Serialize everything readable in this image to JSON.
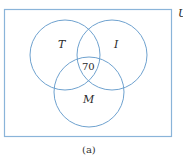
{
  "diagram": {
    "type": "venn",
    "universe_label": "U",
    "sets": [
      {
        "name": "T",
        "label": "T"
      },
      {
        "name": "I",
        "label": "I"
      },
      {
        "name": "M",
        "label": "M"
      }
    ],
    "regions": [
      {
        "sets": [
          "T",
          "I",
          "M"
        ],
        "value": "70"
      }
    ],
    "caption": "(a)",
    "colors": {
      "circle_stroke": "#6fa2cf",
      "box_stroke": "#8ab4d9",
      "text": "#2a2a2a"
    }
  }
}
